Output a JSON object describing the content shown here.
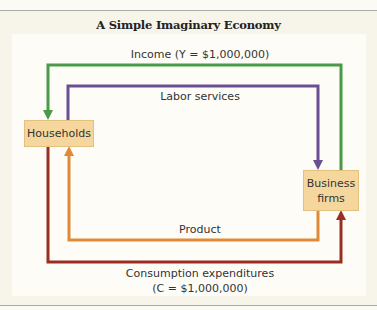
{
  "title": "A Simple Imaginary Economy",
  "nodes": {
    "households": "Households",
    "business_line1": "Business",
    "business_line2": "firms"
  },
  "flows": {
    "income": "Income (Y = $1,000,000)",
    "labor": "Labor services",
    "product": "Product",
    "consumption_line1": "Consumption expenditures",
    "consumption_line2": "(C = $1,000,000)"
  },
  "colors": {
    "income": "#4a9a4a",
    "labor": "#6a4f92",
    "product": "#e08a35",
    "consumption": "#9a2e22",
    "box": "#f5d79e"
  }
}
